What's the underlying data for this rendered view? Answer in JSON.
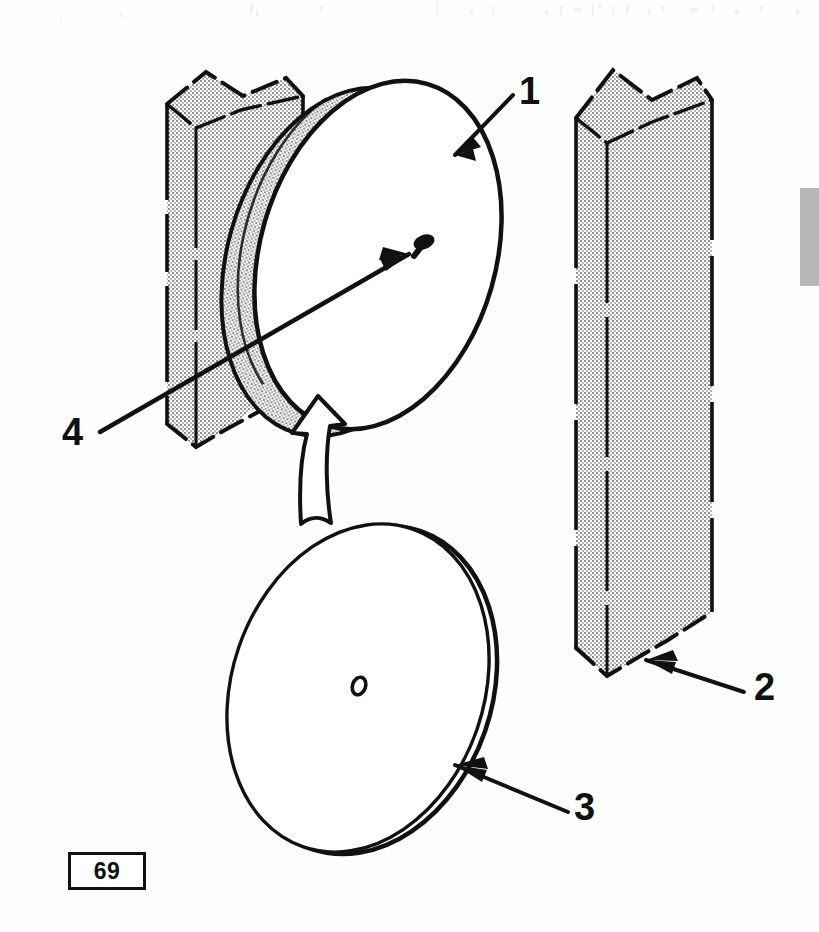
{
  "document": {
    "type": "technical-parts-illustration",
    "title": "Disc mounted to post with nail — exploded assembly view",
    "page_number": "69",
    "background_color": "#ffffff",
    "line_color": "#111111",
    "hatch_fill_color": "#d8d8d8",
    "margin_tab_color": "#b7b7b7"
  },
  "callouts": [
    {
      "id": "1",
      "label": "1",
      "points_to": "upper-disc-rim",
      "arrow_direction": "down-left"
    },
    {
      "id": "2",
      "label": "2",
      "points_to": "right-post-bottom",
      "arrow_direction": "up-left"
    },
    {
      "id": "3",
      "label": "3",
      "points_to": "lower-disc-face",
      "arrow_direction": "up-left"
    },
    {
      "id": "4",
      "label": "4",
      "points_to": "nail-head",
      "arrow_direction": "up-right"
    }
  ],
  "parts": [
    {
      "name": "upper-disc",
      "callout": "1",
      "description": "tilted disc shown installed against post, stippled edge thickness"
    },
    {
      "name": "right-post",
      "callout": "2",
      "description": "stippled square post with broken top and bottom ends"
    },
    {
      "name": "lower-disc",
      "callout": "3",
      "description": "same disc shown detached below, double-line rim, center hole"
    },
    {
      "name": "nail",
      "callout": "4",
      "description": "nail / tack driven through disc center into post"
    },
    {
      "name": "left-post",
      "callout": null,
      "description": "stippled square post with broken top and bottom ends"
    },
    {
      "name": "assembly-arrow",
      "callout": null,
      "description": "hollow curved arrow indicating disc moves up into place"
    }
  ],
  "page_plate": {
    "value": "69"
  },
  "margin_tab": {
    "present": true
  }
}
